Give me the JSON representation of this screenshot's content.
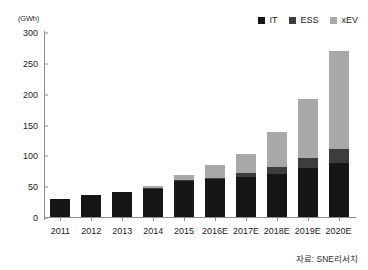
{
  "chart_data": {
    "type": "bar",
    "stacked": true,
    "title": "",
    "subtitle": "",
    "xlabel": "",
    "ylabel": "(GWh)",
    "unit_caption": "(GWh)",
    "grid": false,
    "legend_position": "top-right",
    "categories": [
      "2011",
      "2012",
      "2013",
      "2014",
      "2015",
      "2016E",
      "2017E",
      "2018E",
      "2019E",
      "2020E"
    ],
    "ylim": [
      0,
      300
    ],
    "yticks": [
      0,
      50,
      100,
      150,
      200,
      250,
      300
    ],
    "ytick_labels": [
      "0",
      "50",
      "100",
      "150",
      "200",
      "250",
      "300"
    ],
    "series": [
      {
        "name": "IT",
        "color": "#161616",
        "values": [
          30,
          35,
          41,
          46,
          58,
          61,
          65,
          70,
          80,
          88
        ]
      },
      {
        "name": "ESS",
        "color": "#3d3d3d",
        "values": [
          0,
          0,
          0,
          1,
          2,
          3,
          6,
          11,
          15,
          22
        ]
      },
      {
        "name": "xEV",
        "color": "#a8a8a8",
        "values": [
          0,
          0,
          0,
          3,
          8,
          20,
          32,
          57,
          96,
          160
        ]
      }
    ],
    "totals": [
      30,
      35,
      41,
      50,
      68,
      84,
      103,
      138,
      191,
      270
    ],
    "annotations": [],
    "source_note": "자료: SNE리서치"
  },
  "legend": {
    "items": [
      {
        "label": "IT",
        "swatch_color": "#161616",
        "icon": "square-swatch-icon"
      },
      {
        "label": "ESS",
        "swatch_color": "#3d3d3d",
        "icon": "square-swatch-icon"
      },
      {
        "label": "xEV",
        "swatch_color": "#a8a8a8",
        "icon": "square-swatch-icon"
      }
    ]
  },
  "colors": {
    "axis": "#8d8d8d",
    "text": "#1a1a1a",
    "background": "#ffffff"
  }
}
